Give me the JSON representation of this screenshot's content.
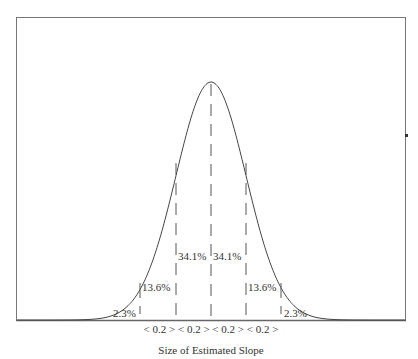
{
  "chart_data": {
    "type": "diagram",
    "title": "",
    "xlabel": "Size of Estimated Slope",
    "mean_x": 211,
    "sigma_px": 35,
    "interval_labels": [
      "< 0.2 >",
      "< 0.2 >",
      "< 0.2 >",
      "< 0.2 >"
    ],
    "regions": [
      {
        "label": "2.3%",
        "range": "below -2σ"
      },
      {
        "label": "13.6%",
        "range": "-2σ to -1σ"
      },
      {
        "label": "34.1%",
        "range": "-1σ to mean"
      },
      {
        "label": "34.1%",
        "range": "mean to +1σ"
      },
      {
        "label": "13.6%",
        "range": "+1σ to +2σ"
      },
      {
        "label": "2.3%",
        "range": "above +2σ"
      }
    ]
  },
  "labels": {
    "left_tail": "2.3%",
    "left_2sd": "13.6%",
    "left_1sd": "34.1%",
    "right_1sd": "34.1%",
    "right_2sd": "13.6%",
    "right_tail": "2.3%",
    "intervals": "< 0.2 > < 0.2 > < 0.2 > < 0.2 >",
    "xlabel": "Size of Estimated Slope"
  }
}
